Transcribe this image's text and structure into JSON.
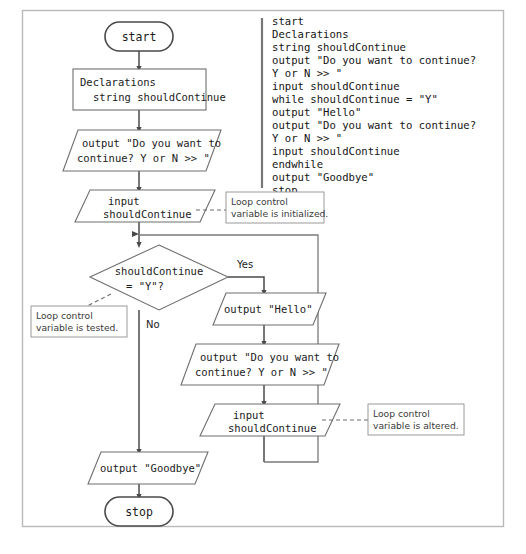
{
  "figure": {
    "caption": ""
  },
  "frame": {
    "color": "#b9b9b9"
  },
  "colors": {
    "shape_stroke": "#6e6e6e",
    "terminator_stroke": "#4a4a4a",
    "flowline": "#4a4a4a",
    "loopline": "#7a7a7a",
    "callout_stroke": "#9a9a9a",
    "text": "#1b1b1b",
    "background": "#ffffff"
  },
  "flowchart": {
    "nodes": {
      "start": {
        "type": "terminator",
        "label": "start"
      },
      "declarations": {
        "type": "process",
        "line1": "Declarations",
        "line2": "string shouldContinue"
      },
      "prompt_first": {
        "type": "io",
        "line1": "output \"Do you want to",
        "line2": "continue? Y or N >> \""
      },
      "input_first": {
        "type": "io",
        "line1": "input",
        "line2": "shouldContinue"
      },
      "decision": {
        "type": "decision",
        "line1": "shouldContinue",
        "line2": "= \"Y\"?",
        "branch_yes": "Yes",
        "branch_no": "No"
      },
      "output_hello": {
        "type": "io",
        "line1": "output \"Hello\""
      },
      "prompt_loop": {
        "type": "io",
        "line1": "output \"Do you want to",
        "line2": "continue? Y or N >> \""
      },
      "input_loop": {
        "type": "io",
        "line1": "input",
        "line2": "shouldContinue"
      },
      "output_goodbye": {
        "type": "io",
        "line1": "output \"Goodbye\""
      },
      "stop": {
        "type": "terminator",
        "label": "stop"
      }
    },
    "callouts": {
      "initialized": {
        "line1": "Loop control",
        "line2": "variable is initialized."
      },
      "tested": {
        "line1": "Loop control",
        "line2": "variable is tested."
      },
      "altered": {
        "line1": "Loop control",
        "line2": "variable is altered."
      }
    }
  },
  "pseudocode": {
    "lines": [
      "start",
      "   Declarations",
      "      string shouldContinue",
      "   output \"Do you want to continue?",
      "      Y or N >> \"",
      "   input shouldContinue",
      "   while shouldContinue = \"Y\"",
      "      output \"Hello\"",
      "      output \"Do you want to continue?",
      "         Y or N >> \"",
      "      input shouldContinue",
      "   endwhile",
      "   output \"Goodbye\"",
      "stop"
    ]
  }
}
